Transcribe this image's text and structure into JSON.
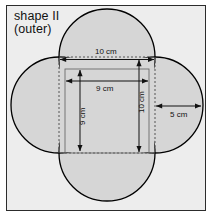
{
  "figure": {
    "title_line_1": "shape II",
    "title_line_2": "(outer)",
    "shape_name": "quatrefoil",
    "colors": {
      "page_background": "#ffffff",
      "panel_background": "#ededed",
      "panel_border": "#2c2c2c",
      "petal_fill": "#d6d6d6",
      "petal_stroke": "#000000",
      "line_color": "#333333",
      "dashed_color": "#555555",
      "text_color": "#111111"
    },
    "dimensions": {
      "outer_square_top": "10 cm",
      "inner_square_horizontal": "9 cm",
      "inner_square_vertical": "9 cm",
      "outer_square_vertical": "10 cm",
      "circle_radius": "5 cm"
    },
    "geometry": {
      "center_x": 107,
      "center_y": 105,
      "dashed_square_side": 96,
      "inner_square_side": 84,
      "circle_radius_px": 48
    }
  }
}
